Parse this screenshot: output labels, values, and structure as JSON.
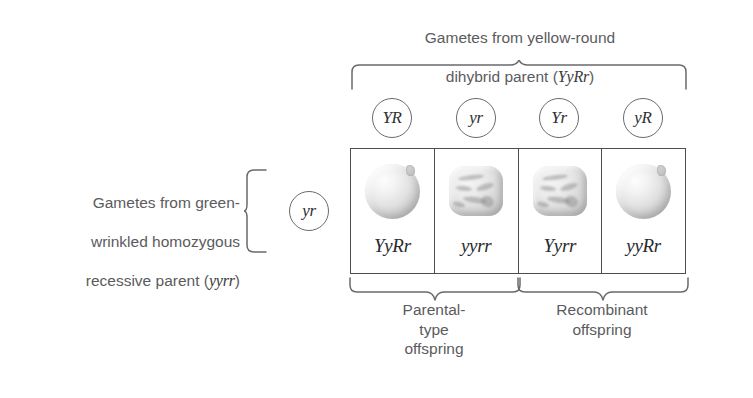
{
  "figure": {
    "title_top_line1": "Gametes from yellow-round",
    "title_top_line2": "dihybrid parent (",
    "title_top_genotype": "YyRr",
    "title_top_line2_end": ")",
    "title_left_line1": "Gametes from green-",
    "title_left_line2": "wrinkled homozygous",
    "title_left_line3": "recessive parent (",
    "title_left_genotype": "yyrr",
    "title_left_line3_end": ")"
  },
  "top_gametes": [
    {
      "label": "YR",
      "name": "gamete-YR"
    },
    {
      "label": "yr",
      "name": "gamete-yr"
    },
    {
      "label": "Yr",
      "name": "gamete-Yr"
    },
    {
      "label": "yR",
      "name": "gamete-yR"
    }
  ],
  "side_gamete": {
    "label": "yr"
  },
  "offspring": [
    {
      "genotype": "YyRr",
      "seed_shape": "round",
      "seed_icon": "round-pea-icon"
    },
    {
      "genotype": "yyrr",
      "seed_shape": "wrinkled",
      "seed_icon": "wrinkled-pea-icon"
    },
    {
      "genotype": "Yyrr",
      "seed_shape": "wrinkled",
      "seed_icon": "wrinkled-pea-icon"
    },
    {
      "genotype": "yyRr",
      "seed_shape": "round",
      "seed_icon": "round-pea-icon"
    }
  ],
  "bottom_captions": {
    "parental": "Parental-\ntype\noffspring",
    "recombinant": "Recombinant\noffspring"
  },
  "colors": {
    "text": "#5b5b5d",
    "genotype_text": "#2b2b2d",
    "line": "#4d4d4f",
    "background": "#ffffff"
  }
}
